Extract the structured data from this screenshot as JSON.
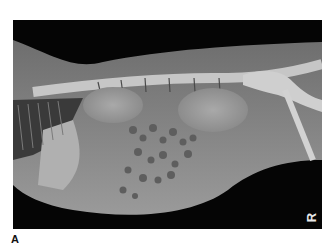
{
  "figure": {
    "label": "A",
    "marker": {
      "letter": "R",
      "sub": "A1"
    },
    "colors": {
      "background": "#050505",
      "soft_tissue": "#8a8a8a",
      "bone": "#d6d6d6"
    }
  }
}
